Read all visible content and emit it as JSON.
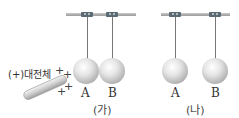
{
  "panels": [
    {
      "caption": "(가)",
      "balls": [
        {
          "label": "A"
        },
        {
          "label": "B"
        }
      ],
      "rod": {
        "label": "(+)대전체",
        "charges": [
          "+",
          "+",
          "+",
          "+"
        ]
      }
    },
    {
      "caption": "(나)",
      "balls": [
        {
          "label": "A"
        },
        {
          "label": "B"
        }
      ]
    }
  ]
}
